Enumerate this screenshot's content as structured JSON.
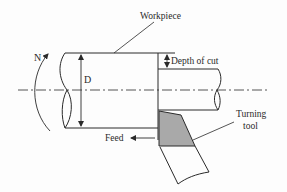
{
  "diagram": {
    "type": "turning-operation-schematic",
    "labels": {
      "workpiece": "Workpiece",
      "depth_of_cut": "Depth of cut",
      "diameter": "D",
      "rotation": "N",
      "turning_tool_line1": "Turning",
      "turning_tool_line2": "tool",
      "feed": "Feed"
    },
    "colors": {
      "line": "#2a2a2a",
      "tool_fill": "#a9a9a9",
      "background": "#fdfdfd"
    }
  }
}
